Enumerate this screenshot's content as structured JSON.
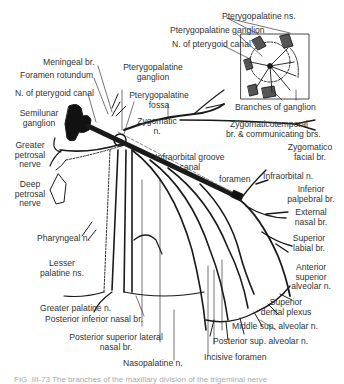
{
  "figure": {
    "caption": "FIG. III-73  The branches of the maxillary division of the trigeminal nerve",
    "inset": {
      "labels": {
        "pterygopalatine_ns": "Pterygopalatine ns.",
        "pterygopalatine_ganglion": "Pterygopalatine ganglion",
        "n_of_pterygoid_canal": "N. of pterygoid canal",
        "branches_of_ganglion": "Branches of ganglion"
      }
    },
    "labels": {
      "meningeal_br": "Meningeal br.",
      "foramen_rotundum": "Foramen rotundum",
      "n_of_pterygoid_canal": "N. of pterygoid canal",
      "semilunar_ganglion_1": "Semilunar",
      "semilunar_ganglion_2": "ganglion",
      "pterygopalatine_ganglion_1": "Pterygopalatine",
      "pterygopalatine_ganglion_2": "ganglion",
      "pterygopalatine_fossa_1": "Pterygopalatine",
      "pterygopalatine_fossa_2": "fossa",
      "zygomatic_n_1": "Zygomatic",
      "zygomatic_n_2": "n.",
      "zygomaticotemporal_1": "Zygomaticotemporal",
      "zygomaticotemporal_2": "br. & communicating brs.",
      "zygomaticofacial_1": "Zygomatico",
      "zygomaticofacial_2": "facial br.",
      "greater_petrosal_1": "Greater",
      "greater_petrosal_2": "petrosal",
      "greater_petrosal_3": "nerve",
      "deep_petrosal_1": "Deep",
      "deep_petrosal_2": "petrosal",
      "deep_petrosal_3": "nerve",
      "infraorbital_groove_1": "Infraorbital groove",
      "infraorbital_groove_2": "canal",
      "foramen": "foramen",
      "infraorbital_n": "Infraorbital n.",
      "inferior_palpebral_1": "Inferior",
      "inferior_palpebral_2": "palpebral br.",
      "external_nasal_1": "External",
      "external_nasal_2": "nasal br.",
      "superior_labial_1": "Superior",
      "superior_labial_2": "labial br.",
      "pharyngeal_n": "Pharyngeal n.",
      "lesser_palatine_1": "Lesser",
      "lesser_palatine_2": "palatine ns.",
      "anterior_superior_alveolar_1": "Anterior",
      "anterior_superior_alveolar_2": "superior",
      "anterior_superior_alveolar_3": "alveolar n.",
      "superior_dental_plexus_1": "Superior",
      "superior_dental_plexus_2": "dental plexus",
      "greater_palatine_n": "Greater palatine n.",
      "posterior_inferior_nasal": "Posterior inferior nasal br.",
      "middle_sup_alveolar": "Middle sup. alveolar n.",
      "posterior_sup_alveolar": "Posterior sup. alveolar n.",
      "posterior_superior_lateral_1": "Posterior superior lateral",
      "posterior_superior_lateral_2": "nasal br.",
      "incisive_foramen": "Incisive foramen",
      "nasopalatine_n": "Nasopalatine n."
    },
    "colors": {
      "ink": "#1a1a1a",
      "label": "#333333",
      "background": "#ffffff"
    }
  }
}
